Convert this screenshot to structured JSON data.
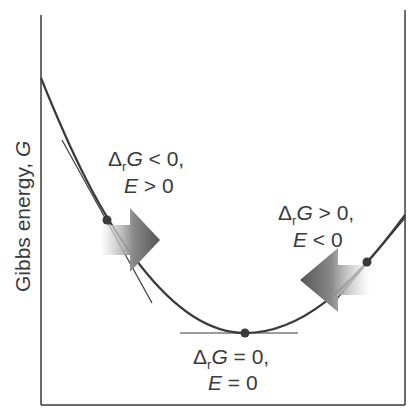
{
  "diagram": {
    "y_axis_label": "Gibbs energy, G",
    "regions": [
      {
        "id": "left",
        "line1": "ΔrG < 0,",
        "line2": "E > 0",
        "arrow_direction": "right"
      },
      {
        "id": "right",
        "line1": "ΔrG > 0,",
        "line2": "E < 0",
        "arrow_direction": "left"
      },
      {
        "id": "minimum",
        "line1": "ΔrG = 0,",
        "line2": "E = 0",
        "arrow_direction": "none"
      }
    ],
    "labels": {
      "y_prefix": "Gibbs energy, ",
      "y_var": "G",
      "left_delta": "Δ",
      "left_sub": "r",
      "left_G": "G",
      "left_rel": " < 0,",
      "left_E": "E",
      "left_Erel": " > 0",
      "right_delta": "Δ",
      "right_sub": "r",
      "right_G": "G",
      "right_rel": " > 0,",
      "right_E": "E",
      "right_Erel": " < 0",
      "min_delta": "Δ",
      "min_sub": "r",
      "min_G": "G",
      "min_rel": " = 0,",
      "min_E": "E",
      "min_Erel": " = 0"
    },
    "colors": {
      "line": "#3a3a3a",
      "arrow_dark": "#555555",
      "arrow_light": "#ffffff",
      "text": "#3a3a3a"
    }
  }
}
